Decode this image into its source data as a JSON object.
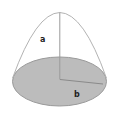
{
  "figure": {
    "labels": {
      "slant": "a",
      "radius": "b"
    },
    "colors": {
      "background": "#ffffff",
      "base_fill": "#bcbcbc",
      "base_stroke": "#9a9a9a",
      "curve_stroke": "#b3b3b3",
      "height_line_stroke": "#9a9a9a",
      "radius_line_stroke": "#8a8a8a",
      "label_color": "#1f1f1f"
    }
  }
}
